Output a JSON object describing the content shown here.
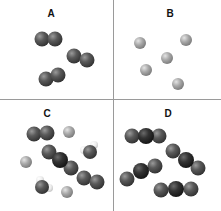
{
  "quadrants": [
    {
      "label": "A",
      "label_x": 51,
      "label_y": 8,
      "description": "diatomic molecules, same element"
    },
    {
      "label": "B",
      "label_x": 170,
      "label_y": 8,
      "description": "single atoms"
    },
    {
      "label": "C",
      "label_x": 47,
      "label_y": 108,
      "description": "mixture of substances"
    },
    {
      "label": "D",
      "label_x": 168,
      "label_y": 108,
      "description": "triatomic molecules, compound"
    }
  ],
  "colors": {
    "dark_atom": "#555555",
    "darker_atom": "#2e2e2e",
    "light_atom": "#a8a8a8",
    "white_atom": "#eeeeee",
    "divider": "#9a9a9a"
  },
  "atoms": [
    {
      "q": "A",
      "x": 42,
      "y": 39,
      "r": 7.5,
      "type": "dark"
    },
    {
      "q": "A",
      "x": 55,
      "y": 39,
      "r": 7.5,
      "type": "dark"
    },
    {
      "q": "A",
      "x": 74,
      "y": 56,
      "r": 7.5,
      "type": "dark"
    },
    {
      "q": "A",
      "x": 87,
      "y": 60,
      "r": 7.5,
      "type": "dark"
    },
    {
      "q": "A",
      "x": 46,
      "y": 79,
      "r": 7.5,
      "type": "dark"
    },
    {
      "q": "A",
      "x": 58,
      "y": 75,
      "r": 7.5,
      "type": "dark"
    },
    {
      "q": "B",
      "x": 140,
      "y": 43,
      "r": 6,
      "type": "light"
    },
    {
      "q": "B",
      "x": 186,
      "y": 40,
      "r": 6,
      "type": "light"
    },
    {
      "q": "B",
      "x": 167,
      "y": 58,
      "r": 6,
      "type": "light"
    },
    {
      "q": "B",
      "x": 146,
      "y": 70,
      "r": 6,
      "type": "light"
    },
    {
      "q": "B",
      "x": 178,
      "y": 84,
      "r": 6,
      "type": "light"
    },
    {
      "q": "C",
      "x": 34,
      "y": 134,
      "r": 7.5,
      "type": "dark"
    },
    {
      "q": "C",
      "x": 47,
      "y": 133,
      "r": 7.5,
      "type": "dark"
    },
    {
      "q": "C",
      "x": 69,
      "y": 132,
      "r": 6,
      "type": "light"
    },
    {
      "q": "C",
      "x": 26,
      "y": 162,
      "r": 6,
      "type": "light"
    },
    {
      "q": "C",
      "x": 49,
      "y": 152,
      "r": 7.5,
      "type": "dark"
    },
    {
      "q": "C",
      "x": 71,
      "y": 168,
      "r": 7.5,
      "type": "dark"
    },
    {
      "q": "C",
      "x": 60,
      "y": 160,
      "r": 8,
      "type": "darker"
    },
    {
      "q": "C",
      "x": 84,
      "y": 178,
      "r": 7.5,
      "type": "dark"
    },
    {
      "q": "C",
      "x": 97,
      "y": 182,
      "r": 7.5,
      "type": "dark"
    },
    {
      "q": "C",
      "x": 94,
      "y": 145,
      "r": 4,
      "type": "white"
    },
    {
      "q": "C",
      "x": 84,
      "y": 150,
      "r": 4,
      "type": "white"
    },
    {
      "q": "C",
      "x": 90,
      "y": 152,
      "r": 7,
      "type": "dark"
    },
    {
      "q": "C",
      "x": 40,
      "y": 180,
      "r": 4,
      "type": "white"
    },
    {
      "q": "C",
      "x": 49,
      "y": 188,
      "r": 4,
      "type": "white"
    },
    {
      "q": "C",
      "x": 42,
      "y": 187,
      "r": 7,
      "type": "dark"
    },
    {
      "q": "C",
      "x": 67,
      "y": 192,
      "r": 6,
      "type": "light"
    },
    {
      "q": "D",
      "x": 132,
      "y": 136,
      "r": 7.5,
      "type": "dark"
    },
    {
      "q": "D",
      "x": 159,
      "y": 136,
      "r": 7.5,
      "type": "dark"
    },
    {
      "q": "D",
      "x": 146,
      "y": 136,
      "r": 8,
      "type": "darker"
    },
    {
      "q": "D",
      "x": 173,
      "y": 151,
      "r": 7.5,
      "type": "dark"
    },
    {
      "q": "D",
      "x": 198,
      "y": 168,
      "r": 7.5,
      "type": "dark"
    },
    {
      "q": "D",
      "x": 186,
      "y": 160,
      "r": 8,
      "type": "darker"
    },
    {
      "q": "D",
      "x": 127,
      "y": 179,
      "r": 7.5,
      "type": "dark"
    },
    {
      "q": "D",
      "x": 155,
      "y": 166,
      "r": 7.5,
      "type": "dark"
    },
    {
      "q": "D",
      "x": 141,
      "y": 171,
      "r": 8,
      "type": "darker"
    },
    {
      "q": "D",
      "x": 161,
      "y": 190,
      "r": 7.5,
      "type": "dark"
    },
    {
      "q": "D",
      "x": 191,
      "y": 189,
      "r": 7.5,
      "type": "dark"
    },
    {
      "q": "D",
      "x": 176,
      "y": 189,
      "r": 8,
      "type": "darker"
    }
  ]
}
